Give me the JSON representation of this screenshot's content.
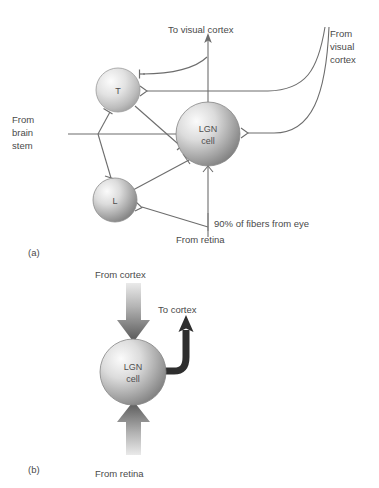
{
  "figure": {
    "title_a": "(a)",
    "title_b": "(b)",
    "background_color": "#ffffff",
    "line_color": "#6d6d6d",
    "text_color": "#4a4a4a",
    "arrow_dark_color": "#4a4a4a",
    "arrow_light_color": "#d8d8d8",
    "cell_fill_light": "#f2f2f2",
    "cell_fill_dark": "#8f8f8f"
  },
  "panel_a": {
    "label": "(a)",
    "nodes": [
      {
        "id": "T",
        "label": "T",
        "cx": 118,
        "cy": 90,
        "r": 22
      },
      {
        "id": "L",
        "label": "L",
        "cx": 115,
        "cy": 200,
        "r": 22
      },
      {
        "id": "LGN",
        "label_line1": "LGN",
        "label_line2": "cell",
        "cx": 208,
        "cy": 134,
        "r": 32
      }
    ],
    "labels": {
      "to_visual_cortex": "To visual cortex",
      "from_visual_cortex_line1": "From",
      "from_visual_cortex_line2": "visual",
      "from_visual_cortex_line3": "cortex",
      "from_brain_stem_line1": "From",
      "from_brain_stem_line2": "brain",
      "from_brain_stem_line3": "stem",
      "percent_fibers": "90% of fibers from eye",
      "from_retina": "From retina"
    }
  },
  "panel_b": {
    "label": "(b)",
    "nodes": [
      {
        "id": "LGN",
        "label_line1": "LGN",
        "label_line2": "cell",
        "cx": 133,
        "cy": 372,
        "r": 33
      }
    ],
    "labels": {
      "from_cortex": "From cortex",
      "to_cortex": "To cortex",
      "from_retina": "From retina"
    }
  }
}
